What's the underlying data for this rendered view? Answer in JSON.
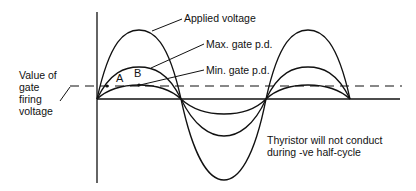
{
  "diagram": {
    "labels": {
      "applied_voltage": "Applied voltage",
      "max_gate_pd": "Max. gate p.d.",
      "min_gate_pd": "Min. gate p.d.",
      "firing_voltage_line1": "Value of",
      "firing_voltage_line2": "gate",
      "firing_voltage_line3": "firing",
      "firing_voltage_line4": "voltage",
      "note_line1": "Thyristor will not conduct",
      "note_line2": "during -ve half-cycle",
      "point_a": "A",
      "point_b": "B"
    },
    "curves": [
      {
        "name": "Applied voltage",
        "amplitude": 69
      },
      {
        "name": "Max. gate p.d.",
        "amplitude": 32
      },
      {
        "name": "Min. gate p.d.",
        "amplitude": 14
      }
    ],
    "colors": {
      "line": "#111111",
      "background": "#ffffff"
    }
  }
}
